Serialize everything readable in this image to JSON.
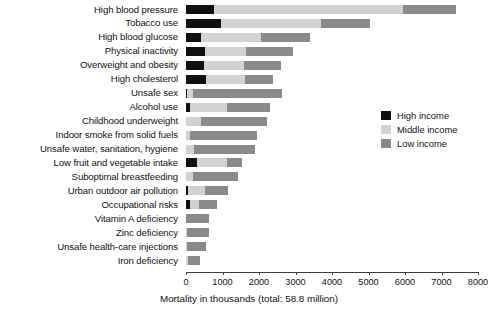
{
  "chart_data": {
    "type": "bar",
    "orientation": "horizontal",
    "stacked": true,
    "title": "",
    "xlabel": "Mortality in thousands (total: 58.8 million)",
    "ylabel": "",
    "xlim": [
      0,
      8000
    ],
    "xticks": [
      0,
      1000,
      2000,
      3000,
      4000,
      5000,
      6000,
      7000,
      8000
    ],
    "xtick_labels": [
      "0",
      "1000",
      "2000",
      "3000",
      "4000",
      "5000",
      "6000",
      "7000",
      "8000"
    ],
    "grid": false,
    "legend_position": "right",
    "categories": [
      "High blood pressure",
      "Tobacco use",
      "High blood glucose",
      "Physical inactivity",
      "Overweight and obesity",
      "High cholesterol",
      "Unsafe sex",
      "Alcohol use",
      "Childhood underweight",
      "Indoor smoke from solid fuels",
      "Unsafe water, sanitation, hygiene",
      "Low fruit and vegetable intake",
      "Suboptimal breastfeeding",
      "Urban outdoor air pollution",
      "Occupational risks",
      "Vitamin A deficiency",
      "Zinc deficiency",
      "Unsafe health-care injections",
      "Iron deficiency"
    ],
    "series": [
      {
        "name": "High income",
        "color": "#101010",
        "values": [
          760,
          970,
          400,
          520,
          490,
          560,
          40,
          110,
          0,
          0,
          0,
          290,
          0,
          60,
          110,
          0,
          0,
          0,
          0
        ]
      },
      {
        "name": "Middle income",
        "color": "#d2d2d2",
        "values": [
          5190,
          2720,
          1650,
          1120,
          1100,
          1050,
          160,
          1010,
          420,
          120,
          210,
          820,
          180,
          470,
          250,
          0,
          20,
          40,
          60
        ]
      },
      {
        "name": "Low income",
        "color": "#8a8a8a",
        "values": [
          1450,
          1340,
          1350,
          1280,
          1010,
          780,
          2430,
          1180,
          1800,
          1830,
          1680,
          420,
          1250,
          620,
          490,
          630,
          610,
          500,
          330
        ]
      }
    ],
    "totals": [
      7400,
      5030,
      3400,
      2920,
      2600,
      2390,
      2630,
      2300,
      2220,
      1950,
      1890,
      1530,
      1430,
      1150,
      850,
      630,
      630,
      540,
      390
    ],
    "legend": [
      "High income",
      "Middle income",
      "Low income"
    ]
  },
  "legend": {
    "items": [
      {
        "label": "High income",
        "color": "#101010",
        "name": "high-income"
      },
      {
        "label": "Middle income",
        "color": "#d2d2d2",
        "name": "middle-income"
      },
      {
        "label": "Low income",
        "color": "#8a8a8a",
        "name": "low-income"
      }
    ]
  },
  "axis": {
    "title": "Mortality in thousands (total: 58.8 million)"
  }
}
